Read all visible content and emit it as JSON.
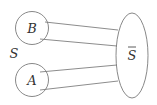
{
  "diagram": {
    "set_label": "S",
    "complement_label": "S",
    "complement_has_overline": true,
    "nodes": [
      {
        "id": "B",
        "label": "B",
        "shape": "circle"
      },
      {
        "id": "A",
        "label": "A",
        "shape": "circle"
      },
      {
        "id": "Sbar",
        "label": "S",
        "shape": "ellipse",
        "overline": true
      }
    ],
    "edges": [
      {
        "from": "B",
        "to": "Sbar"
      },
      {
        "from": "B",
        "to": "Sbar"
      },
      {
        "from": "A",
        "to": "Sbar"
      },
      {
        "from": "A",
        "to": "Sbar"
      }
    ],
    "colors": {
      "stroke": "#7a7a7a",
      "text": "#333333",
      "background": "#ffffff"
    }
  }
}
